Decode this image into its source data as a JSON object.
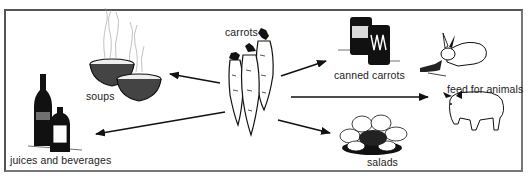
{
  "diagram": {
    "center": {
      "label": "carrots"
    },
    "uses": [
      {
        "id": "soups",
        "label": "soups"
      },
      {
        "id": "juices",
        "label": "juices and beverages"
      },
      {
        "id": "canned",
        "label": "canned carrots"
      },
      {
        "id": "feed",
        "label": "feed for animals"
      },
      {
        "id": "salads",
        "label": "salads"
      }
    ]
  },
  "colors": {
    "ink": "#111111",
    "border": "#555555",
    "background": "#ffffff"
  }
}
